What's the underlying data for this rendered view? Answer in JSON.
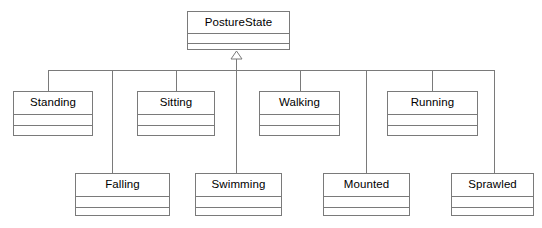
{
  "diagram": {
    "kind": "uml-class-diagram",
    "relationship": "generalization",
    "background_color": "#ffffff",
    "line_color": "#7a7a7a",
    "text_color": "#000000",
    "root": {
      "name": "PostureState",
      "x": 187,
      "y": 11,
      "width": 103,
      "height": 39
    },
    "arrowhead": {
      "type": "hollow-triangle",
      "x": 236,
      "y": 51,
      "width": 11,
      "height": 8
    },
    "bus": {
      "y": 70,
      "x_start": 48,
      "x_end": 494
    },
    "subclasses": [
      {
        "name": "Standing",
        "x": 13,
        "y": 91,
        "width": 80,
        "height": 45,
        "stub_x": 48,
        "row": "middle"
      },
      {
        "name": "Sitting",
        "x": 137,
        "y": 91,
        "width": 78,
        "height": 45,
        "stub_x": 176,
        "row": "middle"
      },
      {
        "name": "Walking",
        "x": 259,
        "y": 91,
        "width": 81,
        "height": 45,
        "stub_x": 300,
        "row": "middle"
      },
      {
        "name": "Running",
        "x": 387,
        "y": 91,
        "width": 91,
        "height": 45,
        "stub_x": 432,
        "row": "middle"
      },
      {
        "name": "Falling",
        "x": 75,
        "y": 173,
        "width": 95,
        "height": 43,
        "stub_x": 112,
        "row": "bottom"
      },
      {
        "name": "Swimming",
        "x": 195,
        "y": 173,
        "width": 87,
        "height": 43,
        "stub_x": 236,
        "row": "bottom"
      },
      {
        "name": "Mounted",
        "x": 323,
        "y": 173,
        "width": 87,
        "height": 43,
        "stub_x": 366,
        "row": "bottom"
      },
      {
        "name": "Sprawled",
        "x": 451,
        "y": 173,
        "width": 83,
        "height": 43,
        "stub_x": 494,
        "row": "bottom"
      }
    ]
  },
  "chart_data": {
    "type": "diagram",
    "diagram_type": "uml-class-diagram",
    "nodes": [
      "PostureState",
      "Standing",
      "Sitting",
      "Walking",
      "Running",
      "Falling",
      "Swimming",
      "Mounted",
      "Sprawled"
    ],
    "edges": [
      {
        "from": "Standing",
        "to": "PostureState",
        "type": "generalization"
      },
      {
        "from": "Sitting",
        "to": "PostureState",
        "type": "generalization"
      },
      {
        "from": "Walking",
        "to": "PostureState",
        "type": "generalization"
      },
      {
        "from": "Running",
        "to": "PostureState",
        "type": "generalization"
      },
      {
        "from": "Falling",
        "to": "PostureState",
        "type": "generalization"
      },
      {
        "from": "Swimming",
        "to": "PostureState",
        "type": "generalization"
      },
      {
        "from": "Mounted",
        "to": "PostureState",
        "type": "generalization"
      },
      {
        "from": "Sprawled",
        "to": "PostureState",
        "type": "generalization"
      }
    ]
  }
}
